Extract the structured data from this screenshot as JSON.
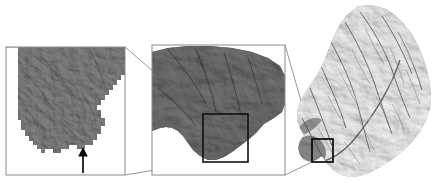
{
  "figure": {
    "background_color": "#ffffff",
    "width": 440,
    "height": 189,
    "frame_color": "#8a8a8a",
    "connector_color": "#8a8a8a",
    "inset_box_color": "#111111",
    "arrow_color": "#0a0a0a"
  },
  "panels": [
    {
      "id": "panel-left",
      "name": "pixel-scale-detail-panel",
      "label": "",
      "zoom_level": "pixel scale",
      "x": 6,
      "y": 47,
      "width": 119,
      "height": 128,
      "render": "coarse pixelated raster, near-black shaded relief with stair-stepped watershed boundary",
      "dominant_tone": "#0d0d0d",
      "has_arrow_marker": true,
      "arrow": {
        "name": "outlet-arrow",
        "x": 83,
        "tip_y": 148,
        "tail_y": 173,
        "direction": "up"
      }
    },
    {
      "id": "panel-middle",
      "name": "subbasin-detail-panel",
      "label": "",
      "zoom_level": "sub-basin scale",
      "x": 152,
      "y": 45,
      "width": 133,
      "height": 130,
      "render": "dark hillshaded relief of lower sub-basin with ridge and valley texture",
      "dominant_tone": "#1a1a1a",
      "inset_box": {
        "name": "inset-box-middle",
        "x": 203,
        "y": 114,
        "width": 45,
        "height": 48
      }
    },
    {
      "id": "panel-right",
      "name": "full-watershed-panel",
      "label": "",
      "zoom_level": "full watershed",
      "x": 292,
      "y": 4,
      "width": 146,
      "height": 182,
      "render": "grayscale hillshade of elongated dendritic watershed, northeast trending ridges",
      "dominant_tone": "#8f8f8f",
      "inset_box": {
        "name": "inset-box-right",
        "x": 312,
        "y": 139,
        "width": 21,
        "height": 23
      }
    }
  ],
  "connectors": [
    {
      "name": "connector-middle-to-left-top",
      "x1": 203,
      "y1": 114,
      "x2": 125,
      "y2": 47
    },
    {
      "name": "connector-middle-to-left-bottom",
      "x1": 203,
      "y1": 162,
      "x2": 125,
      "y2": 175
    },
    {
      "name": "connector-right-to-middle-top",
      "x1": 312,
      "y1": 139,
      "x2": 285,
      "y2": 45
    },
    {
      "name": "connector-right-to-middle-bottom",
      "x1": 312,
      "y1": 162,
      "x2": 285,
      "y2": 175
    }
  ],
  "chart_data": {
    "type": "heatmap",
    "xlabel": "",
    "ylabel": "",
    "legend": [],
    "annotations": [
      "outlet arrow in left panel",
      "inset box in middle panel",
      "inset box in right panel"
    ],
    "series": [
      {
        "name": "pixel scale detail",
        "values": []
      },
      {
        "name": "sub-basin detail",
        "values": []
      },
      {
        "name": "full watershed DEM",
        "values": []
      }
    ]
  }
}
